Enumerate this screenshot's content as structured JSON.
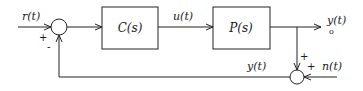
{
  "diagram": {
    "type": "feedback-control-block-diagram",
    "signals": {
      "reference": "r(t)",
      "control": "u(t)",
      "output_main": "y",
      "output_main_arg": "(t)",
      "output_sub": "o",
      "measured": "y(t)",
      "noise": "n(t)"
    },
    "blocks": {
      "controller": "C(s)",
      "plant": "P(s)"
    },
    "signs": {
      "sum1_reference": "+",
      "sum1_feedback": "-",
      "sum2_output": "+",
      "sum2_noise": "+"
    },
    "colors": {
      "line": "#222222",
      "background": "#ffffff"
    }
  }
}
